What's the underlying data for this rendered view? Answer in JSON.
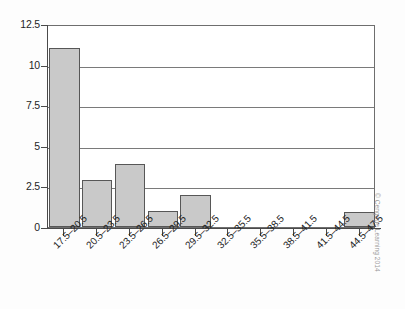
{
  "chart_data": {
    "type": "bar",
    "title": "",
    "subtitle": "",
    "xlabel": "",
    "ylabel": "",
    "categories": [
      "17.5–20.5",
      "20.5–23.5",
      "23.5–26.5",
      "26.5–29.5",
      "29.5–32.5",
      "32.5–35.5",
      "35.5–38.5",
      "38.5–41.5",
      "41.5–44.5",
      "44.5–47.5"
    ],
    "values": [
      11,
      2.9,
      3.9,
      1,
      2,
      0,
      0,
      0,
      0,
      0.9
    ],
    "ylim": [
      0,
      12.5
    ],
    "yticks": [
      0,
      2.5,
      5,
      7.5,
      10,
      12.5
    ],
    "ytick_labels": [
      "0",
      "2.5",
      "5",
      "7.5",
      "10",
      "12.5"
    ],
    "grid": true,
    "grid_axis": "y",
    "legend": false,
    "legend_position": "none",
    "bar_fill_color": "#c9c9c9",
    "bar_edge_color": "#575757",
    "axis_color": "#4a4a4a",
    "grid_color": "#7a7a7a",
    "background_color": "#ffffff"
  },
  "annotations": {
    "credit": "© Cengage Learning 2014"
  }
}
